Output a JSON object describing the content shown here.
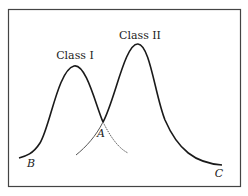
{
  "diagram": {
    "type": "overlapping-distributions",
    "curves": [
      {
        "name": "Class I",
        "label": "Class I",
        "peak": [
          74,
          66
        ]
      },
      {
        "name": "Class II",
        "label": "Class II",
        "peak": [
          138,
          44
        ]
      }
    ],
    "points": {
      "A": "A",
      "B": "B",
      "C": "C"
    },
    "colors": {
      "stroke": "#1a1a1a",
      "tail": "#555555",
      "frame": "#444444",
      "background": "#ffffff"
    }
  }
}
